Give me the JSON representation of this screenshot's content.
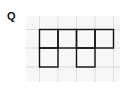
{
  "label": "Q",
  "grid": {
    "x0": 26,
    "y0": 16,
    "cell": 18.7,
    "cols": 5,
    "rows": 3.5,
    "background": "#f7f7f7",
    "line_color": "#dddddd"
  },
  "shape": {
    "stroke": "#111111",
    "cells": [
      [
        0,
        0
      ],
      [
        1,
        0
      ],
      [
        2,
        0
      ],
      [
        3,
        0
      ],
      [
        0,
        1
      ],
      [
        2,
        1
      ]
    ],
    "origin_col": 0.7,
    "origin_row": 0.7
  }
}
